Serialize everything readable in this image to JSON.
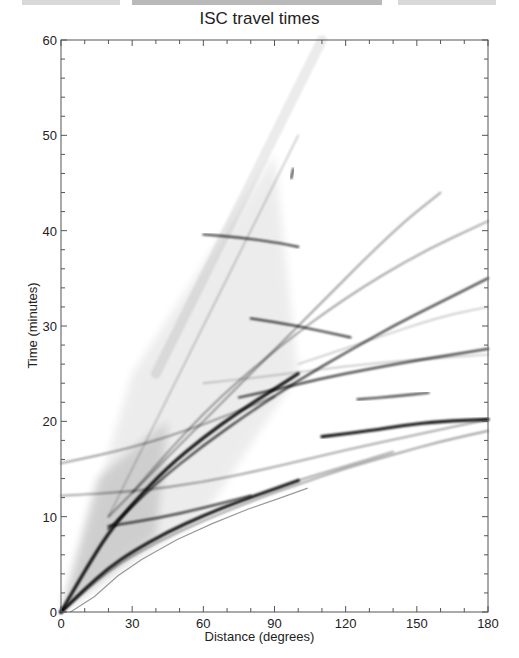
{
  "chart_data": {
    "type": "scatter",
    "title": "ISC travel times",
    "xlabel": "Distance (degrees)",
    "ylabel": "Time (minutes)",
    "xlim": [
      0,
      180
    ],
    "ylim": [
      0,
      60
    ],
    "xticks": [
      0,
      30,
      60,
      90,
      120,
      150,
      180
    ],
    "yticks": [
      0,
      10,
      20,
      30,
      40,
      50,
      60
    ],
    "grid": false,
    "legend": null,
    "series": [
      {
        "name": "P",
        "x": [
          0,
          10,
          20,
          30,
          45,
          60,
          75,
          90,
          100
        ],
        "y": [
          0,
          2.4,
          4.6,
          6.3,
          8.4,
          10.1,
          11.6,
          12.9,
          13.8
        ],
        "intensity": "very dark"
      },
      {
        "name": "Pdiff",
        "x": [
          100,
          120,
          140
        ],
        "y": [
          13.8,
          15.3,
          16.8
        ],
        "intensity": "medium"
      },
      {
        "name": "PKP",
        "x": [
          110,
          130,
          145,
          160,
          180
        ],
        "y": [
          18.4,
          19.0,
          19.6,
          20.0,
          20.2
        ],
        "intensity": "very dark"
      },
      {
        "name": "S",
        "x": [
          0,
          10,
          20,
          30,
          45,
          60,
          75,
          90,
          100
        ],
        "y": [
          0,
          4.3,
          8.3,
          11.3,
          15.2,
          18.3,
          21.0,
          23.4,
          25.0
        ],
        "intensity": "very dark"
      },
      {
        "name": "SKS",
        "x": [
          75,
          90,
          110,
          130,
          150,
          180
        ],
        "y": [
          22.5,
          23.3,
          24.5,
          25.5,
          26.4,
          27.6
        ],
        "intensity": "dark"
      },
      {
        "name": "PP",
        "x": [
          0,
          20,
          40,
          60,
          80,
          100,
          120,
          140,
          160,
          180
        ],
        "y": [
          0,
          4.4,
          7.3,
          9.6,
          11.6,
          13.4,
          15.1,
          16.5,
          17.9,
          19.0
        ],
        "intensity": "medium"
      },
      {
        "name": "PKiKP / PKIKP",
        "x": [
          0,
          30,
          60,
          90,
          120,
          150,
          180
        ],
        "y": [
          12.2,
          12.6,
          13.6,
          15.2,
          17.0,
          18.6,
          20.2
        ],
        "intensity": "medium"
      },
      {
        "name": "ScP / PcP",
        "x": [
          20,
          40,
          60,
          80
        ],
        "y": [
          9.0,
          9.8,
          10.9,
          12.2
        ],
        "intensity": "dark"
      },
      {
        "name": "SS",
        "x": [
          20,
          40,
          60,
          80,
          100,
          120,
          140,
          160,
          180
        ],
        "y": [
          8.7,
          13.5,
          17.5,
          21.0,
          24.3,
          27.2,
          30.0,
          32.5,
          35.0
        ],
        "intensity": "dark"
      },
      {
        "name": "ScS",
        "x": [
          0,
          30,
          60,
          90
        ],
        "y": [
          15.6,
          17.2,
          19.6,
          22.6
        ],
        "intensity": "medium"
      },
      {
        "name": "PKKP",
        "x": [
          60,
          90,
          120,
          150,
          180
        ],
        "y": [
          24.0,
          24.8,
          25.8,
          26.5,
          27.0
        ],
        "intensity": "light"
      },
      {
        "name": "SKKS",
        "x": [
          100,
          130,
          160,
          180
        ],
        "y": [
          26.0,
          28.5,
          31.0,
          32.0
        ],
        "intensity": "light"
      },
      {
        "name": "SSS",
        "x": [
          30,
          60,
          90,
          120,
          150,
          180
        ],
        "y": [
          12.5,
          21.0,
          27.5,
          33.0,
          37.5,
          41.0
        ],
        "intensity": "medium"
      },
      {
        "name": "PKPPKP-like (fast)",
        "x": [
          20,
          60,
          100,
          140,
          160
        ],
        "y": [
          10.0,
          20.0,
          30.0,
          40.0,
          44.0
        ],
        "intensity": "medium"
      },
      {
        "name": "SKP/PKS branch",
        "x": [
          125,
          140,
          155
        ],
        "y": [
          22.3,
          22.6,
          23.0
        ],
        "intensity": "dark"
      },
      {
        "name": "PPP (steep)",
        "x": [
          20,
          40,
          60,
          80,
          100
        ],
        "y": [
          10.0,
          20.0,
          30.0,
          40.0,
          50.0
        ],
        "intensity": "light"
      },
      {
        "name": "Surface-wave diffuse branch",
        "x": [
          40,
          60,
          80,
          100,
          110
        ],
        "y": [
          25,
          35,
          45,
          55,
          60
        ],
        "intensity": "very light"
      },
      {
        "name": "Core-reflection (40 min)",
        "x": [
          60,
          75,
          90,
          100
        ],
        "y": [
          39.6,
          39.3,
          38.8,
          38.3
        ],
        "intensity": "dark"
      },
      {
        "name": "ScSScS",
        "x": [
          80,
          100,
          122
        ],
        "y": [
          30.8,
          30.0,
          28.8
        ],
        "intensity": "dark"
      },
      {
        "name": "short segment 46 min",
        "x": [
          97,
          98
        ],
        "y": [
          45.5,
          46.5
        ],
        "intensity": "dark"
      }
    ]
  }
}
